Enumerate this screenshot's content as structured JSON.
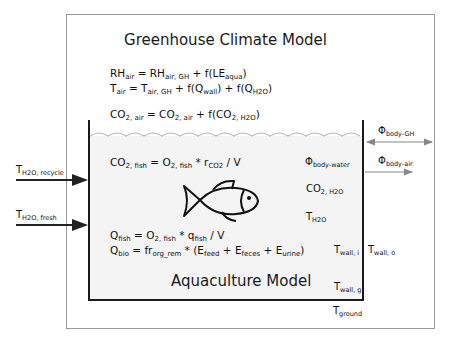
{
  "greenhouse": {
    "title": "Greenhouse Climate Model",
    "eq_rh": {
      "a": "RH",
      "a_sub": "air",
      "b": " = RH",
      "b_sub": "air, GH",
      "c": " + f(LE",
      "c_sub": "aqua",
      "d": ")"
    },
    "eq_t": {
      "a": "T",
      "a_sub": "air",
      "b": " = T",
      "b_sub": "air, GH",
      "c": " + f(Q",
      "c_sub": "wall",
      "d": ") + f(Q",
      "d_sub": "H2O",
      "e": ")"
    },
    "eq_co2": {
      "a": "CO",
      "a_sub": "2, air",
      "b": " = CO",
      "b_sub": "2, air",
      "c": " + f(CO",
      "c_sub": "2, H2O",
      "d": ")"
    }
  },
  "aquaculture": {
    "title": "Aquaculture Model",
    "eq_co2_fish": {
      "a": "CO",
      "a_sub": "2, fish",
      "b": " = O",
      "b_sub": "2, fish",
      "c": " * r",
      "c_sub": "CO2",
      "d": " / V"
    },
    "eq_q_fish": {
      "a": "Q",
      "a_sub": "fish",
      "b": " = O",
      "b_sub": "2, fish",
      "c": " * q",
      "c_sub": "fish",
      "d": " / V"
    },
    "eq_q_bio": {
      "a": "Q",
      "a_sub": "bio",
      "b": " = fr",
      "b_sub": "org_rem",
      "c": " * (E",
      "c_sub": "feed",
      "d": " + E",
      "d_sub": "feces",
      "e": " + E",
      "e_sub": "urine",
      "f": ")"
    },
    "labels": {
      "phi_body_water": {
        "m": "Φ",
        "s": "body-water"
      },
      "co2_h2o": {
        "m": "CO",
        "s": "2, H2O"
      },
      "t_h2o": {
        "m": "T",
        "s": "H2O"
      },
      "t_wall_i": {
        "m": "T",
        "s": "wall, i"
      },
      "t_wall_g": {
        "m": "T",
        "s": "wall, g"
      }
    }
  },
  "outside": {
    "phi_body_gh": {
      "m": "Φ",
      "s": "body-GH"
    },
    "phi_body_air": {
      "m": "Φ",
      "s": "body-air"
    },
    "t_wall_o": {
      "m": "T",
      "s": "wall, o"
    },
    "t_ground": {
      "m": "T",
      "s": "ground"
    },
    "t_h2o_recycle": {
      "m": "T",
      "s": "H2O, recycle"
    },
    "t_h2o_fresh": {
      "m": "T",
      "s": "H2O, fresh"
    }
  },
  "colors": {
    "outer_border": "#9a9a9a",
    "inner_border": "#1a1a1a",
    "water_fill": "#f4f4f4"
  }
}
